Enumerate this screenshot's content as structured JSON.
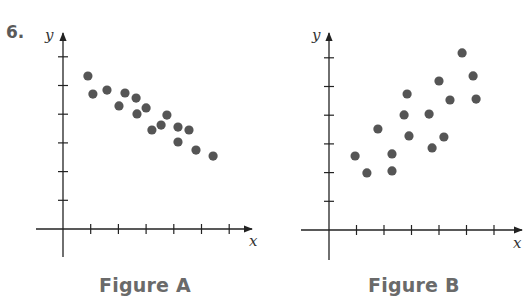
{
  "problem": {
    "number": "6."
  },
  "colors": {
    "dot": "#555555",
    "axis": "#222222",
    "caption": "#6a6a6a"
  },
  "chart_data": [
    {
      "type": "scatter",
      "title": "Figure A",
      "xlabel": "x",
      "ylabel": "y",
      "xlim": [
        0,
        7
      ],
      "ylim": [
        0,
        6.5
      ],
      "x_ticks": [
        1,
        2,
        3,
        4,
        5,
        6
      ],
      "y_ticks": [
        1,
        2,
        3,
        4,
        5,
        6
      ],
      "tick_labels": "none",
      "grid": false,
      "trend": "negative",
      "points": [
        {
          "x": 0.9,
          "y": 5.33
        },
        {
          "x": 1.08,
          "y": 4.7
        },
        {
          "x": 1.59,
          "y": 4.84
        },
        {
          "x": 2.02,
          "y": 4.29
        },
        {
          "x": 2.24,
          "y": 4.74
        },
        {
          "x": 2.64,
          "y": 4.56
        },
        {
          "x": 2.67,
          "y": 4.01
        },
        {
          "x": 3.0,
          "y": 4.22
        },
        {
          "x": 3.21,
          "y": 3.45
        },
        {
          "x": 3.54,
          "y": 3.62
        },
        {
          "x": 3.75,
          "y": 3.97
        },
        {
          "x": 4.15,
          "y": 3.55
        },
        {
          "x": 4.15,
          "y": 3.03
        },
        {
          "x": 4.55,
          "y": 3.45
        },
        {
          "x": 4.8,
          "y": 2.75
        },
        {
          "x": 5.42,
          "y": 2.54
        }
      ]
    },
    {
      "type": "scatter",
      "title": "Figure B",
      "xlabel": "x",
      "ylabel": "y",
      "xlim": [
        0,
        7
      ],
      "ylim": [
        0,
        6.5
      ],
      "x_ticks": [
        1,
        2,
        3,
        4,
        5,
        6
      ],
      "y_ticks": [
        1,
        2,
        3,
        4,
        5,
        6
      ],
      "tick_labels": "none",
      "grid": false,
      "trend": "positive",
      "points": [
        {
          "x": 0.95,
          "y": 2.58
        },
        {
          "x": 1.38,
          "y": 1.99
        },
        {
          "x": 1.78,
          "y": 3.52
        },
        {
          "x": 2.29,
          "y": 2.65
        },
        {
          "x": 2.29,
          "y": 2.06
        },
        {
          "x": 2.73,
          "y": 4.01
        },
        {
          "x": 2.84,
          "y": 4.74
        },
        {
          "x": 2.91,
          "y": 3.28
        },
        {
          "x": 3.64,
          "y": 4.04
        },
        {
          "x": 3.75,
          "y": 2.86
        },
        {
          "x": 4.0,
          "y": 5.19
        },
        {
          "x": 4.18,
          "y": 3.24
        },
        {
          "x": 4.4,
          "y": 4.53
        },
        {
          "x": 4.84,
          "y": 6.17
        },
        {
          "x": 5.24,
          "y": 5.37
        },
        {
          "x": 5.35,
          "y": 4.56
        }
      ]
    }
  ]
}
